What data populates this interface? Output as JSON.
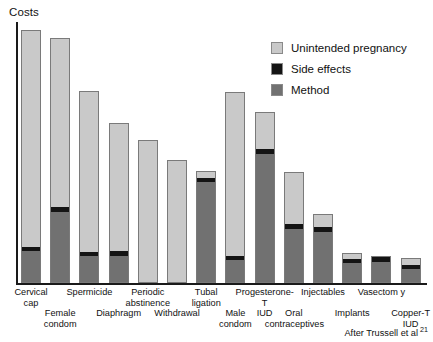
{
  "chart_data": {
    "type": "bar",
    "subtype": "stacked-bar",
    "title": "",
    "ylabel": "Costs",
    "xlabel": "",
    "grid": false,
    "axis_tick_labels": [],
    "ylim": [
      0,
      100
    ],
    "y_axis_units": "relative cost (unlabeled axis)",
    "legend_position": "top-right",
    "categories": [
      "Cervical cap",
      "Female condom",
      "Spermicide",
      "Diaphragm",
      "Periodic abstinence",
      "Withdrawal",
      "Tubal ligation",
      "Male condom",
      "Progesterone-T IUD",
      "Oral contraceptives",
      "Injectables",
      "Implants",
      "Vasectom y",
      "Copper-T IUD"
    ],
    "categories_plotted": [
      "Cervical cap",
      "Female condom",
      "Spermicide",
      "Diaphragm",
      "Periodic abstinence",
      "Withdrawal",
      "Tubal ligation",
      "Male condom",
      "Progesterone-T IUD",
      "Oral contraceptives",
      "Injectables",
      "Implants",
      "Vasectom y",
      "Copper-T IUD"
    ],
    "series": [
      {
        "name": "Method",
        "color": "#717171",
        "values": [
          11.9,
          27.2,
          10.0,
          10.0,
          0.0,
          0.0,
          39.1,
          8.4,
          49.8,
          20.7,
          19.9,
          8.0,
          8.4,
          5.4
        ]
      },
      {
        "name": "Side effects",
        "color": "#141414",
        "values": [
          1.5,
          1.9,
          1.5,
          1.9,
          0.0,
          0.0,
          1.5,
          1.5,
          1.9,
          1.9,
          1.9,
          1.5,
          1.9,
          1.5
        ]
      },
      {
        "name": "Unintended pregnancy",
        "color": "#c9c9c9",
        "values": [
          83.5,
          64.8,
          62.1,
          49.4,
          54.8,
          47.1,
          2.3,
          63.2,
          13.8,
          19.9,
          4.6,
          1.9,
          0.0,
          2.7
        ]
      }
    ],
    "totals": [
      96.9,
      93.9,
      73.6,
      61.3,
      54.8,
      47.1,
      42.9,
      73.1,
      65.5,
      42.5,
      26.4,
      11.4,
      10.3,
      9.6
    ]
  },
  "axis": {
    "y_title": "Costs"
  },
  "legend": {
    "items": [
      {
        "label": "Unintended pregnancy",
        "color": "#c9c9c9"
      },
      {
        "label": "Side effects",
        "color": "#141414"
      },
      {
        "label": "Method",
        "color": "#717171"
      }
    ]
  },
  "x_labels": [
    {
      "text": "Cervical\ncap",
      "row": "top"
    },
    {
      "text": "Female\ncondom",
      "row": "bottom"
    },
    {
      "text": "Spermicide",
      "row": "top"
    },
    {
      "text": "Diaphragm",
      "row": "bottom"
    },
    {
      "text": "Periodic\nabstinence",
      "row": "top"
    },
    {
      "text": "Withdrawal",
      "row": "bottom"
    },
    {
      "text": "Tubal\nligation",
      "row": "top"
    },
    {
      "text": "Male\ncondom",
      "row": "bottom"
    },
    {
      "text": "Progesterone-T\nIUD",
      "row": "top"
    },
    {
      "text": "Oral\ncontraceptives",
      "row": "bottom"
    },
    {
      "text": "Injectables",
      "row": "top"
    },
    {
      "text": "Implants",
      "row": "bottom"
    },
    {
      "text": "Vasectom y",
      "row": "top"
    },
    {
      "text": "Copper-T\nIUD",
      "row": "bottom"
    }
  ],
  "footnote": {
    "text": "After Trussell et al",
    "reference": "21"
  }
}
